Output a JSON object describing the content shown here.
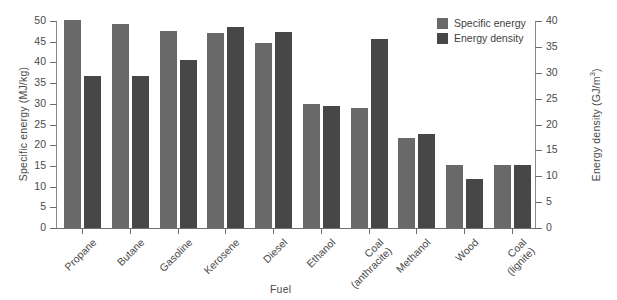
{
  "chart_data": {
    "type": "bar",
    "title": "",
    "xlabel": "Fuel",
    "categories": [
      "Propane",
      "Butane",
      "Gasoline",
      "Kerosene",
      "Diesel",
      "Ethanol",
      "Coal\n(anthracite)",
      "Methanol",
      "Wood",
      "Coal\n(lignite)"
    ],
    "series": [
      {
        "name": "Specific energy",
        "unit": "MJ/kg",
        "axis": "left",
        "color": "#696969",
        "values": [
          50.3,
          49.3,
          47.5,
          47.2,
          44.8,
          30.0,
          29.0,
          21.8,
          15.2,
          15.3
        ]
      },
      {
        "name": "Energy density",
        "unit": "GJ/m³",
        "axis": "right",
        "color": "#474747",
        "values": [
          29.3,
          29.3,
          32.5,
          38.9,
          37.8,
          23.5,
          36.6,
          18.1,
          9.4,
          12.2
        ]
      }
    ],
    "axes": {
      "left": {
        "label": "Specific energy (MJ/kg)",
        "ticks": [
          0,
          5,
          10,
          15,
          20,
          25,
          30,
          35,
          40,
          45,
          50
        ],
        "lim": [
          0,
          50
        ]
      },
      "right": {
        "label_prefix": "Energy density (GJ/m",
        "label_sup": "3",
        "label_suffix": ")",
        "ticks": [
          0,
          5,
          10,
          15,
          20,
          25,
          30,
          35,
          40
        ],
        "lim": [
          0,
          40
        ]
      }
    },
    "grid": false,
    "legend_position": "top-right",
    "legend": [
      "Specific energy",
      "Energy density"
    ]
  }
}
